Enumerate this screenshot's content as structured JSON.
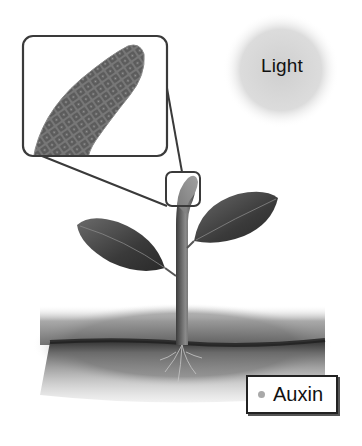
{
  "diagram": {
    "topic": "phototropism",
    "light_label": "Light",
    "legend": {
      "items": [
        {
          "label": "Auxin",
          "marker_color": "#a9a9a9"
        }
      ]
    },
    "parts": [
      "light-source",
      "shoot-tip-magnified",
      "shoot-tip",
      "stem",
      "leaf-left",
      "leaf-right",
      "grass",
      "soil",
      "roots"
    ],
    "colors": {
      "background": "#ffffff",
      "light_glow": "#d6d6d6",
      "outline": "#3a3a3a",
      "leaf": "#4a4a4a",
      "soil": "#5a5a5a"
    }
  }
}
